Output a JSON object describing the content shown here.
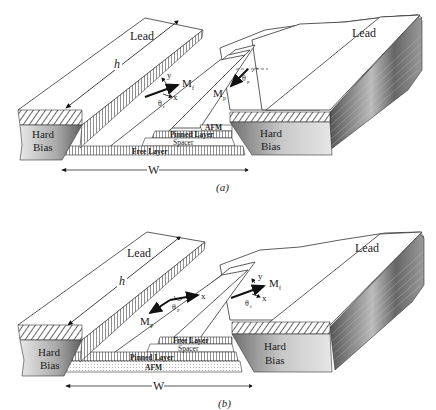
{
  "figure": {
    "panels": [
      {
        "id": "a",
        "caption": "(a)",
        "left_lead_label": "Lead",
        "right_lead_label": "Lead",
        "left_bias_label_line1": "Hard",
        "left_bias_label_line2": "Bias",
        "right_bias_label_line1": "Hard",
        "right_bias_label_line2": "Bias",
        "height_label": "h",
        "width_label": "W",
        "layers": [
          "AFM",
          "Pinned Layer",
          "Spacer",
          "Free Layer"
        ],
        "free_moment": {
          "label": "M",
          "sub": "f",
          "angle_label": "θ",
          "angle_sub": "f",
          "x_axis": "x",
          "y_axis": "y"
        },
        "pinned_moment": {
          "label": "M",
          "sub": "p",
          "angle_label": "θ",
          "angle_sub": "p"
        }
      },
      {
        "id": "b",
        "caption": "(b)",
        "left_lead_label": "Lead",
        "right_lead_label": "Lead",
        "left_bias_label_line1": "Hard",
        "left_bias_label_line2": "Bias",
        "right_bias_label_line1": "Hard",
        "right_bias_label_line2": "Bias",
        "height_label": "h",
        "width_label": "W",
        "layers": [
          "Free Layer",
          "Spacer",
          "Pinned Layer",
          "AFM"
        ],
        "pinned_moment": {
          "label": "M",
          "sub": "P",
          "angle_label": "θ",
          "angle_sub": "P",
          "x_axis": "x"
        },
        "free_moment": {
          "label": "M",
          "sub": "f",
          "angle_label": "θ",
          "angle_sub": "f",
          "x_axis": "x",
          "y_axis": "y"
        }
      }
    ]
  }
}
